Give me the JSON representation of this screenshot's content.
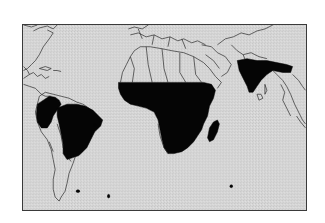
{
  "map": {
    "type": "world distribution map",
    "projection_extent": "Americas to Southeast Asia",
    "background_color": "#d6d6d6",
    "border_color": "#3a3a3a",
    "outline_color": "#2a2a2a",
    "highlight_color": "#050505",
    "highlighted_regions": [
      {
        "id": "northern-south-america",
        "label": "Northwestern South America"
      },
      {
        "id": "brazil",
        "label": "Brazil"
      },
      {
        "id": "sub-saharan-africa",
        "label": "Sub-Saharan Africa"
      },
      {
        "id": "madagascar",
        "label": "Madagascar"
      },
      {
        "id": "south-asia",
        "label": "South Asia"
      },
      {
        "id": "south-atlantic-islands",
        "label": "South Atlantic islands"
      },
      {
        "id": "indian-ocean-island",
        "label": "Indian Ocean island"
      }
    ],
    "outlined_landmasses": [
      "North America",
      "Central America",
      "Caribbean",
      "South America",
      "Europe",
      "North Africa",
      "Middle East",
      "Asia",
      "Southeast Asia"
    ]
  }
}
